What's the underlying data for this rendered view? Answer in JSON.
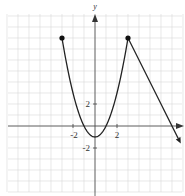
{
  "chart_data": {
    "type": "line",
    "title": "",
    "xlabel": "x",
    "ylabel": "y",
    "grid": true,
    "xlim": [
      -8,
      8
    ],
    "ylim": [
      -6,
      10
    ],
    "x_tick_labels": [
      {
        "value": -2,
        "label": "-2"
      },
      {
        "value": 2,
        "label": "2"
      }
    ],
    "y_tick_labels": [
      {
        "value": 2,
        "label": "2"
      },
      {
        "value": -2,
        "label": "-2"
      }
    ],
    "series": [
      {
        "name": "parabola",
        "equation": "y = x^2 - 1",
        "domain": [
          -3,
          3
        ],
        "points": [
          [
            -3,
            8
          ],
          [
            -2,
            3
          ],
          [
            -1,
            0
          ],
          [
            0,
            -1
          ],
          [
            1,
            0
          ],
          [
            2,
            3
          ],
          [
            3,
            8
          ]
        ],
        "left_endpoint": {
          "x": -3,
          "y": 8,
          "closed": true
        }
      },
      {
        "name": "line",
        "equation": "y = -2x + 14",
        "domain": [
          3,
          7.8
        ],
        "points": [
          [
            3,
            8
          ],
          [
            7,
            0
          ],
          [
            7.8,
            -1.6
          ]
        ],
        "start_point": {
          "x": 3,
          "y": 8,
          "closed": true
        },
        "end_arrow": true
      }
    ]
  },
  "labels": {
    "y_axis": "y",
    "x_neg2": "-2",
    "x_pos2": "2",
    "y_pos2": "2",
    "y_neg2": "-2"
  },
  "colors": {
    "grid": "#d9d9d9",
    "axis": "#444444",
    "curve": "#222222"
  }
}
